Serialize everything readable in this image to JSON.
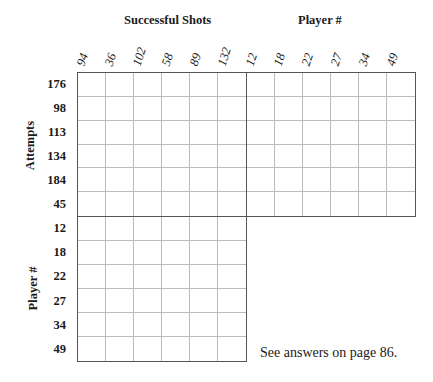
{
  "headers": {
    "top_left": "Successful Shots",
    "top_right": "Player #",
    "side_top": "Attempts",
    "side_bottom": "Player #"
  },
  "columns": {
    "successful_shots": [
      "94",
      "36",
      "102",
      "58",
      "89",
      "132"
    ],
    "player_numbers": [
      "12",
      "18",
      "22",
      "27",
      "34",
      "49"
    ]
  },
  "rows": {
    "attempts": [
      "176",
      "98",
      "113",
      "134",
      "184",
      "45"
    ],
    "player_numbers": [
      "12",
      "18",
      "22",
      "27",
      "34",
      "49"
    ]
  },
  "footer": {
    "note": "See answers on page 86."
  }
}
